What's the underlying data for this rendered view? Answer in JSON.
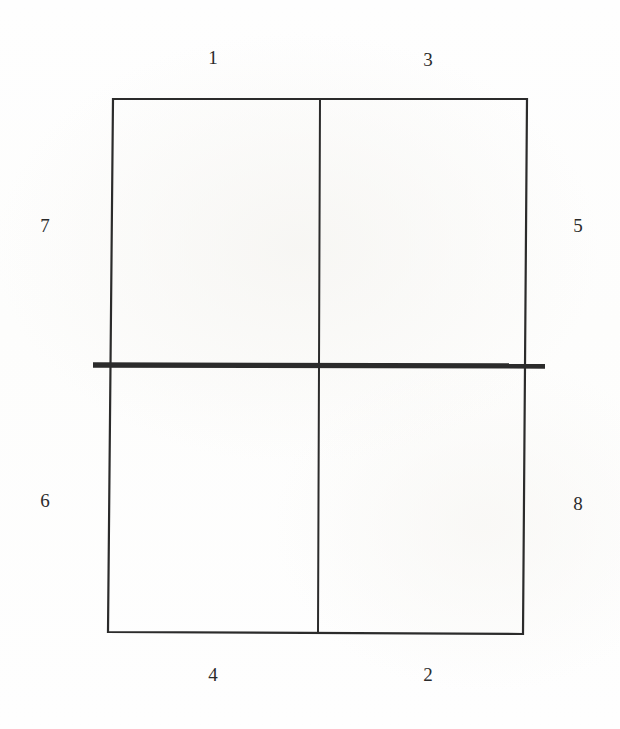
{
  "figure": {
    "type": "diagram",
    "background_color": "#fefefe",
    "stroke_color": "#2b2b2b",
    "thick_line_color": "#2b2b2b",
    "label_color": "#2b2b2b"
  },
  "geometry": {
    "outer_rect": {
      "top_left": [
        113,
        99
      ],
      "top_right": [
        527,
        99
      ],
      "bottom_right": [
        523,
        634
      ],
      "bottom_left": [
        108,
        632
      ],
      "stroke_width": 2.2
    },
    "vertical_divider": {
      "top": [
        320,
        99
      ],
      "bottom": [
        318,
        633
      ],
      "stroke_width": 2.0
    },
    "thick_horizontal_line": {
      "start": [
        93,
        365
      ],
      "end": [
        545,
        366
      ],
      "stroke_width": 5.4
    }
  },
  "labels": [
    {
      "id": "label-1",
      "text": "1",
      "x": 213,
      "y": 57,
      "position": "top-left-segment"
    },
    {
      "id": "label-3",
      "text": "3",
      "x": 428,
      "y": 59,
      "position": "top-right-segment"
    },
    {
      "id": "label-7",
      "text": "7",
      "x": 45,
      "y": 225,
      "position": "left-upper-segment"
    },
    {
      "id": "label-5",
      "text": "5",
      "x": 578,
      "y": 225,
      "position": "right-upper-segment"
    },
    {
      "id": "label-6",
      "text": "6",
      "x": 45,
      "y": 500,
      "position": "left-lower-segment"
    },
    {
      "id": "label-8",
      "text": "8",
      "x": 578,
      "y": 503,
      "position": "right-lower-segment"
    },
    {
      "id": "label-4",
      "text": "4",
      "x": 213,
      "y": 674,
      "position": "bottom-left-segment"
    },
    {
      "id": "label-2",
      "text": "2",
      "x": 428,
      "y": 674,
      "position": "bottom-right-segment"
    }
  ]
}
